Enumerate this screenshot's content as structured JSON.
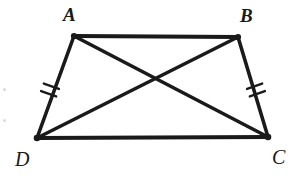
{
  "figure": {
    "shape_name": "isosceles trapezoid",
    "stroke_color": "#1a1a1a",
    "background_color": "#ffffff",
    "canvas": {
      "width": 293,
      "height": 179
    },
    "vertices": [
      {
        "id": "A",
        "label": "A",
        "x": 74,
        "y": 36,
        "label_x": 63,
        "label_y": 5
      },
      {
        "id": "B",
        "label": "B",
        "x": 238,
        "y": 37,
        "label_x": 240,
        "label_y": 6
      },
      {
        "id": "C",
        "label": "C",
        "x": 268,
        "y": 137,
        "label_x": 272,
        "label_y": 147
      },
      {
        "id": "D",
        "label": "D",
        "x": 37,
        "y": 138,
        "label_x": 15,
        "label_y": 149
      }
    ],
    "sides": [
      {
        "name": "AB",
        "from": "A",
        "to": "B",
        "x1": 74,
        "y1": 36,
        "x2": 238,
        "y2": 37,
        "stroke_width": 4.2,
        "tick_marks": 0
      },
      {
        "name": "BC",
        "from": "B",
        "to": "C",
        "x1": 238,
        "y1": 37,
        "x2": 268,
        "y2": 137,
        "stroke_width": 3.6,
        "tick_marks": 2
      },
      {
        "name": "CD",
        "from": "C",
        "to": "D",
        "x1": 268,
        "y1": 137,
        "x2": 37,
        "y2": 138,
        "stroke_width": 3.8,
        "tick_marks": 0
      },
      {
        "name": "DA",
        "from": "D",
        "to": "A",
        "x1": 37,
        "y1": 138,
        "x2": 74,
        "y2": 36,
        "stroke_width": 3.6,
        "tick_marks": 2
      }
    ],
    "diagonals": [
      {
        "name": "AC",
        "from": "A",
        "to": "C",
        "x1": 74,
        "y1": 36,
        "x2": 268,
        "y2": 137,
        "stroke_width": 3.6
      },
      {
        "name": "BD",
        "from": "B",
        "to": "D",
        "x1": 238,
        "y1": 37,
        "x2": 37,
        "y2": 138,
        "stroke_width": 3.6
      }
    ],
    "diagonal_intersection": {
      "x": 157,
      "y": 78
    },
    "congruence_marks": [
      {
        "on_side": "DA",
        "count": 2,
        "center_x": 50,
        "center_y": 90,
        "tick_offsets": [
          -4,
          4
        ],
        "tick_half_length": 8,
        "angle_deg": 20,
        "stroke_width": 2.4
      },
      {
        "on_side": "BC",
        "count": 2,
        "center_x": 256,
        "center_y": 90,
        "tick_offsets": [
          -4,
          4
        ],
        "tick_half_length": 8,
        "angle_deg": -20,
        "stroke_width": 2.4
      }
    ],
    "artifacts": [
      {
        "name": "left-upper",
        "x": 3,
        "y": 88
      },
      {
        "name": "left-lower",
        "x": 3,
        "y": 119
      }
    ]
  }
}
